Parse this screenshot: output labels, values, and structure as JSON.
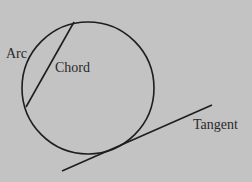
{
  "diagram": {
    "labels": {
      "arc": "Arc",
      "chord": "Chord",
      "tangent": "Tangent"
    },
    "colors": {
      "background": "#c3c3c3",
      "stroke": "#1e1e1e",
      "text": "#2a2a2a"
    },
    "shapes": {
      "circle": {
        "cx": 88,
        "cy": 88,
        "r": 66
      },
      "chord": {
        "x1": 74,
        "y1": 22,
        "x2": 26,
        "y2": 107
      },
      "tangent": {
        "x1": 62,
        "y1": 171,
        "x2": 212,
        "y2": 105
      }
    }
  }
}
